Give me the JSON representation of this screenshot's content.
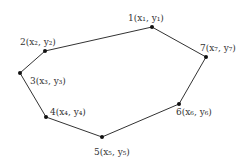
{
  "diagram": {
    "type": "polygon",
    "stroke_color": "#333333",
    "points": [
      {
        "id": 1,
        "label": "1(x₁, y₁)",
        "x": 152,
        "y": 27,
        "lx": 128,
        "ly": 21
      },
      {
        "id": 2,
        "label": "2(x₂, y₂)",
        "x": 45,
        "y": 51,
        "lx": 20,
        "ly": 45
      },
      {
        "id": 3,
        "label": "3(x₃, y₃)",
        "x": 20,
        "y": 73,
        "lx": 30,
        "ly": 84
      },
      {
        "id": 4,
        "label": "4(x₄, y₄)",
        "x": 46,
        "y": 117,
        "lx": 50,
        "ly": 115
      },
      {
        "id": 5,
        "label": "5(x₅, y₅)",
        "x": 102,
        "y": 137,
        "lx": 94,
        "ly": 155
      },
      {
        "id": 6,
        "label": "6(x₆, y₆)",
        "x": 179,
        "y": 104,
        "lx": 176,
        "ly": 115
      },
      {
        "id": 7,
        "label": "7(x₇, y₇)",
        "x": 206,
        "y": 57,
        "lx": 200,
        "ly": 51
      }
    ]
  }
}
